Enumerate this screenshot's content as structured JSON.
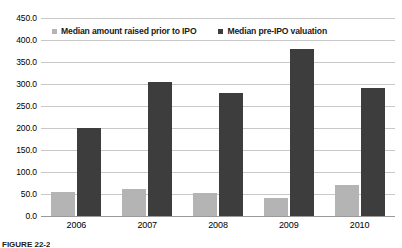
{
  "chart_data": {
    "type": "bar",
    "title": "",
    "xlabel": "",
    "ylabel": "",
    "categories": [
      "2006",
      "2007",
      "2008",
      "2009",
      "2010"
    ],
    "series": [
      {
        "name": "Median amount raised prior to IPO",
        "color": "#b4b4b4",
        "values": [
          55,
          62,
          52,
          40,
          70
        ]
      },
      {
        "name": "Median pre-IPO valuation",
        "color": "#3d3d3d",
        "values": [
          200,
          305,
          280,
          380,
          290
        ]
      }
    ],
    "ylim": [
      0,
      450
    ],
    "ytick_step": 50,
    "ytick_labels": [
      "0.0",
      "50.0",
      "100.0",
      "150.0",
      "200.0",
      "250.0",
      "300.0",
      "350.0",
      "400.0",
      "450.0"
    ],
    "ytick_values": [
      0,
      50,
      100,
      150,
      200,
      250,
      300,
      350,
      400,
      450
    ],
    "grid": true,
    "legend_position": "top-inside"
  },
  "caption": {
    "text": "FIGURE 22-2"
  }
}
